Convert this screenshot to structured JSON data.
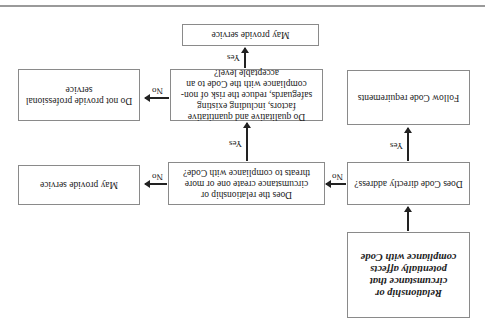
{
  "orientation": "rotated-180",
  "flowchart": {
    "start": "Relationship or circumstance that potentially affects compliance with Code",
    "q1": "Does Code directly address?",
    "q1_yes_result": "Follow Code requirements",
    "q2": "Does the relationship or circumstance create one or more threats to compliance with Code?",
    "q2_no_result": "May provide service",
    "q3": "Do qualitative and quantitative factors, including existing safeguards, reduce the risk of non-compliance with the Code to an acceptable level?",
    "q3_yes_result": "May provide service",
    "q3_no_result": "Do not provide professional service"
  },
  "edge_labels": {
    "q1_yes": "Yes",
    "q1_no": "No",
    "q2_yes": "Yes",
    "q2_no": "No",
    "q3_yes": "Yes",
    "q3_no": "No"
  },
  "colors": {
    "box_border": "#8a8a8a",
    "arrow": "#222222",
    "rule": "#9a9a9a"
  }
}
